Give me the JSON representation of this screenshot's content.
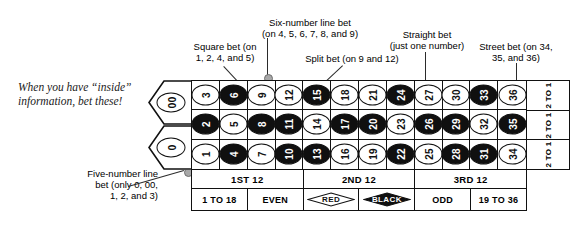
{
  "caption": {
    "text": "When you have “inside” information, bet these!"
  },
  "annotations": {
    "square_bet": "Square bet (on\n1, 2, 4, and 5)",
    "six_number_line_bet": "Six-number line bet\n(on 4, 5, 6, 7, 8, and 9)",
    "split_bet": "Split bet (on 9 and 12)",
    "straight_bet": "Straight bet\n(just one number)",
    "street_bet": "Street bet (on 34,\n35, and 36)",
    "five_number_line_bet": "Five-number line\nbet (only 0, 00,\n1, 2, and 3)"
  },
  "table": {
    "zeros": [
      {
        "label": "00",
        "color": "green"
      },
      {
        "label": "0",
        "color": "green"
      }
    ],
    "rows": [
      [
        {
          "n": "3",
          "color": "red"
        },
        {
          "n": "6",
          "color": "black"
        },
        {
          "n": "9",
          "color": "red"
        },
        {
          "n": "12",
          "color": "red"
        },
        {
          "n": "15",
          "color": "black"
        },
        {
          "n": "18",
          "color": "red"
        },
        {
          "n": "21",
          "color": "red"
        },
        {
          "n": "24",
          "color": "black"
        },
        {
          "n": "27",
          "color": "red"
        },
        {
          "n": "30",
          "color": "red"
        },
        {
          "n": "33",
          "color": "black"
        },
        {
          "n": "36",
          "color": "red"
        }
      ],
      [
        {
          "n": "2",
          "color": "black"
        },
        {
          "n": "5",
          "color": "red"
        },
        {
          "n": "8",
          "color": "black"
        },
        {
          "n": "11",
          "color": "black"
        },
        {
          "n": "14",
          "color": "red"
        },
        {
          "n": "17",
          "color": "black"
        },
        {
          "n": "20",
          "color": "black"
        },
        {
          "n": "23",
          "color": "red"
        },
        {
          "n": "26",
          "color": "black"
        },
        {
          "n": "29",
          "color": "black"
        },
        {
          "n": "32",
          "color": "red"
        },
        {
          "n": "35",
          "color": "black"
        }
      ],
      [
        {
          "n": "1",
          "color": "red"
        },
        {
          "n": "4",
          "color": "black"
        },
        {
          "n": "7",
          "color": "red"
        },
        {
          "n": "10",
          "color": "black"
        },
        {
          "n": "13",
          "color": "black"
        },
        {
          "n": "16",
          "color": "red"
        },
        {
          "n": "19",
          "color": "red"
        },
        {
          "n": "22",
          "color": "black"
        },
        {
          "n": "25",
          "color": "red"
        },
        {
          "n": "28",
          "color": "black"
        },
        {
          "n": "31",
          "color": "black"
        },
        {
          "n": "34",
          "color": "red"
        }
      ]
    ],
    "column_bets": [
      "2 TO 1",
      "2 TO 1",
      "2 TO 1"
    ],
    "dozens": [
      "1ST 12",
      "2ND 12",
      "3RD 12"
    ],
    "outside_bets": [
      "1 TO 18",
      "EVEN",
      "RED",
      "BLACK",
      "ODD",
      "19 TO 36"
    ]
  },
  "colors": {
    "black_pocket": "#101010",
    "red_pocket": "#ffffff",
    "ink": "#111111",
    "leader_dot": "#a8a8a8"
  }
}
